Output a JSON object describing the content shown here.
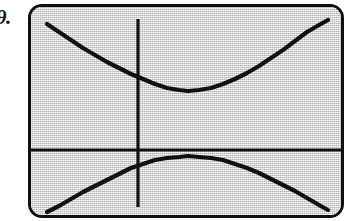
{
  "figure": {
    "exercise_number": "9.",
    "caption": "",
    "device": "graphing-calculator-screen"
  },
  "colors": {
    "screen_background": "#d8d8d8",
    "bezel": "#101010",
    "ink": "#111111",
    "page": "#ffffff"
  },
  "chart_data": {
    "type": "line",
    "title": "",
    "subtitle": "",
    "xlabel": "",
    "ylabel": "",
    "grid": false,
    "legend": null,
    "axes": {
      "x_axis_visible": true,
      "y_axis_visible": true,
      "x_axis_screen_y": 143,
      "y_axis_screen_x": 107,
      "tick_marks": false,
      "tick_labels": []
    },
    "xlim": [
      0,
      310
    ],
    "ylim": [
      0,
      208
    ],
    "annotations": [],
    "series": [
      {
        "name": "upper branch",
        "description": "upward-opening branch of a hyperbola, vertex near screen point (157, 84)",
        "points": [
          [
            16,
            17
          ],
          [
            28,
            25
          ],
          [
            40,
            33
          ],
          [
            52,
            41
          ],
          [
            64,
            48
          ],
          [
            76,
            55
          ],
          [
            88,
            61
          ],
          [
            100,
            67
          ],
          [
            112,
            72
          ],
          [
            124,
            77
          ],
          [
            136,
            81
          ],
          [
            148,
            83
          ],
          [
            157,
            84
          ],
          [
            168,
            83
          ],
          [
            180,
            81
          ],
          [
            192,
            77
          ],
          [
            204,
            72
          ],
          [
            216,
            66
          ],
          [
            228,
            59
          ],
          [
            240,
            51
          ],
          [
            252,
            43
          ],
          [
            264,
            34
          ],
          [
            276,
            25
          ],
          [
            288,
            18
          ],
          [
            297,
            13
          ]
        ]
      },
      {
        "name": "lower branch",
        "description": "downward-opening branch of a hyperbola, vertex near screen point (157, 150)",
        "points": [
          [
            16,
            205
          ],
          [
            28,
            199
          ],
          [
            40,
            192
          ],
          [
            52,
            185
          ],
          [
            64,
            179
          ],
          [
            76,
            173
          ],
          [
            88,
            167
          ],
          [
            100,
            161
          ],
          [
            112,
            157
          ],
          [
            124,
            153
          ],
          [
            136,
            151
          ],
          [
            148,
            150
          ],
          [
            157,
            149
          ],
          [
            168,
            150
          ],
          [
            180,
            151
          ],
          [
            192,
            153
          ],
          [
            204,
            157
          ],
          [
            216,
            161
          ],
          [
            228,
            166
          ],
          [
            240,
            172
          ],
          [
            252,
            178
          ],
          [
            264,
            184
          ],
          [
            276,
            191
          ],
          [
            288,
            198
          ],
          [
            297,
            203
          ]
        ]
      }
    ]
  }
}
